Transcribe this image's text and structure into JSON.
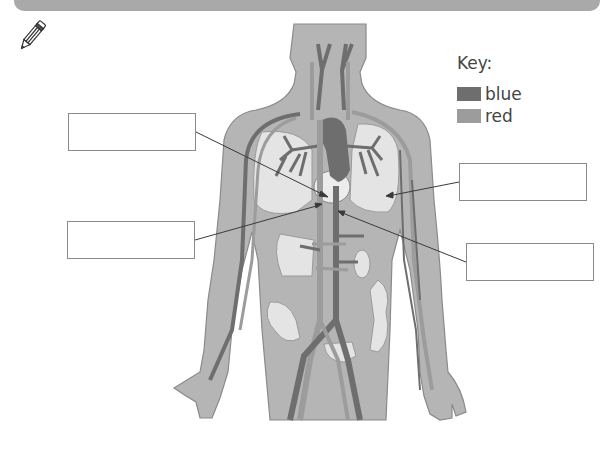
{
  "header": {
    "bar_color": "#a9a9a9"
  },
  "icons": {
    "worksheet_icon": "pencil-icon"
  },
  "key": {
    "title": "Key:",
    "items": [
      {
        "label": "blue",
        "color": "#6e6e6e"
      },
      {
        "label": "red",
        "color": "#9c9c9c"
      }
    ]
  },
  "colors": {
    "body": "#b5b5b5",
    "organ": "#e4e4e4",
    "vein_blue": "#6e6e6e",
    "artery_red": "#9c9c9c",
    "outline": "#8a8a8a"
  },
  "label_boxes": [
    {
      "id": "left-top",
      "value": ""
    },
    {
      "id": "left-bottom",
      "value": ""
    },
    {
      "id": "right-top",
      "value": ""
    },
    {
      "id": "right-bottom",
      "value": ""
    }
  ]
}
